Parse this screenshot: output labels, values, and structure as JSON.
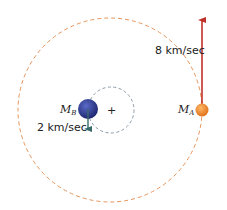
{
  "diagram": {
    "bodies": {
      "A": {
        "label": "M",
        "subscript": "A",
        "speed_label": "8 km/sec",
        "color": "#f08a24"
      },
      "B": {
        "label": "M",
        "subscript": "B",
        "speed_label": "2 km/sec",
        "color": "#2e3a8f"
      }
    },
    "center_of_mass_marker": "+",
    "colors": {
      "orbit_A": "#e8945a",
      "orbit_B": "#8a9aa8",
      "arrow_A": "#c0302a",
      "arrow_B": "#3a6b6b"
    }
  }
}
